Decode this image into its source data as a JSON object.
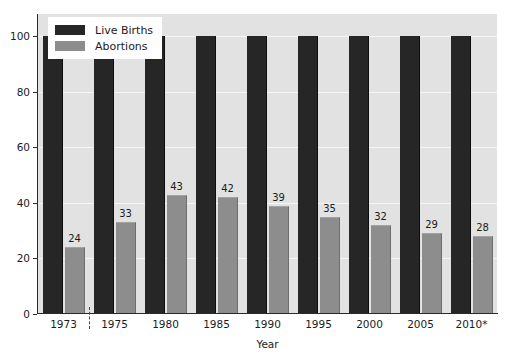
{
  "chart_data": {
    "type": "bar",
    "title": "",
    "xlabel": "Year",
    "ylabel": "",
    "categories": [
      "1973",
      "1975",
      "1980",
      "1985",
      "1990",
      "1995",
      "2000",
      "2005",
      "2010*"
    ],
    "series": [
      {
        "name": "Live Births",
        "color": "#262626",
        "values": [
          100,
          100,
          100,
          100,
          100,
          100,
          100,
          100,
          100
        ],
        "labels": [
          "",
          "",
          "",
          "",
          "",
          "",
          "",
          "",
          ""
        ]
      },
      {
        "name": "Abortions",
        "color": "#8d8d8d",
        "values": [
          24,
          33,
          43,
          42,
          39,
          35,
          32,
          29,
          28
        ],
        "labels": [
          "24",
          "33",
          "43",
          "42",
          "39",
          "35",
          "32",
          "29",
          "28"
        ]
      }
    ],
    "ylim": [
      0,
      108
    ],
    "yticks": [
      0,
      20,
      40,
      60,
      80,
      100
    ],
    "ytick_labels": [
      "0",
      "20",
      "40",
      "60",
      "80",
      "100"
    ],
    "grid": true,
    "grid_color": "#f6f6f6",
    "plot_background": "#e2e2e2",
    "legend_position": "top-left",
    "axis_break_after_category": "1973"
  },
  "axis": {
    "x_title": "Year"
  },
  "legend": {
    "items": [
      {
        "label": "Live Births"
      },
      {
        "label": "Abortions"
      }
    ]
  },
  "title_fragment": "."
}
